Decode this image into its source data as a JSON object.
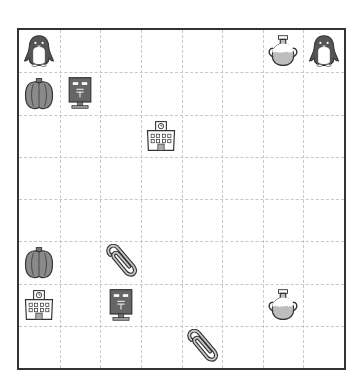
{
  "board": {
    "rows": 8,
    "cols": 8,
    "pieces": [
      {
        "row": 0,
        "col": 0,
        "icon": "penguin"
      },
      {
        "row": 0,
        "col": 6,
        "icon": "vase"
      },
      {
        "row": 0,
        "col": 7,
        "icon": "penguin"
      },
      {
        "row": 1,
        "col": 0,
        "icon": "pumpkin"
      },
      {
        "row": 1,
        "col": 1,
        "icon": "mailbox"
      },
      {
        "row": 2,
        "col": 3,
        "icon": "school"
      },
      {
        "row": 5,
        "col": 0,
        "icon": "pumpkin"
      },
      {
        "row": 5,
        "col": 2,
        "icon": "paperclip"
      },
      {
        "row": 6,
        "col": 0,
        "icon": "school"
      },
      {
        "row": 6,
        "col": 2,
        "icon": "mailbox"
      },
      {
        "row": 6,
        "col": 6,
        "icon": "vase"
      },
      {
        "row": 7,
        "col": 4,
        "icon": "paperclip"
      }
    ]
  },
  "colors": {
    "border": "#333333",
    "gridline": "#c8c8c8",
    "icon_dark": "#444444",
    "icon_mid": "#8a8a8a",
    "icon_light": "#bdbdbd"
  }
}
